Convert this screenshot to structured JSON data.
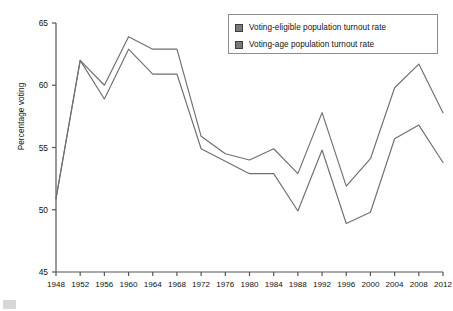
{
  "chart_data": {
    "type": "line",
    "title": "",
    "xlabel": "",
    "ylabel": "Percentage voting",
    "x": [
      1948,
      1952,
      1956,
      1960,
      1964,
      1968,
      1972,
      1976,
      1980,
      1984,
      1988,
      1992,
      1996,
      2000,
      2004,
      2008,
      2012
    ],
    "xticklabels": [
      "1948",
      "1952",
      "1956",
      "1960",
      "1964",
      "1968",
      "1972",
      "1976",
      "1980",
      "1984",
      "1988",
      "1992",
      "1996",
      "2000",
      "2004",
      "2008",
      "2012"
    ],
    "yticklabels": [
      "45",
      "50",
      "55",
      "60",
      "65"
    ],
    "yticks": [
      45,
      50,
      55,
      60,
      65
    ],
    "ylim": [
      45,
      65
    ],
    "xlim": [
      1948,
      2012
    ],
    "grid": false,
    "legend_position": "top-right",
    "series": [
      {
        "name": "Voting-eligible population turnout rate",
        "color": "#6f6f6f",
        "swatch_color": "#7a7a7a",
        "values": [
          50.9,
          62.0,
          60.0,
          63.9,
          62.9,
          62.9,
          55.9,
          54.5,
          54.0,
          54.9,
          52.9,
          57.8,
          51.9,
          54.1,
          59.8,
          61.7,
          57.8
        ]
      },
      {
        "name": "Voting-age population turnout rate",
        "color": "#6f6f6f",
        "swatch_color": "#7a7a7a",
        "values": [
          50.9,
          62.0,
          58.9,
          62.9,
          60.9,
          60.9,
          54.9,
          53.9,
          52.9,
          52.9,
          49.9,
          54.8,
          48.9,
          49.8,
          55.7,
          56.8,
          53.8
        ]
      }
    ]
  },
  "legend": {
    "items": [
      {
        "label": "Voting-eligible population turnout rate"
      },
      {
        "label": "Voting-age population turnout rate"
      }
    ]
  },
  "axis": {
    "y_title": "Percentage voting"
  }
}
